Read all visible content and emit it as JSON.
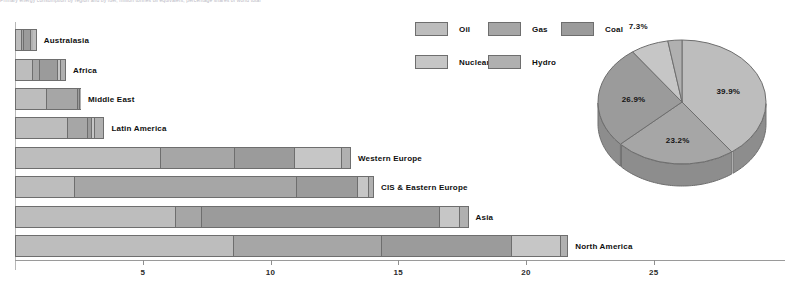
{
  "caption": {
    "text": "Primary energy consumption by region and by fuel, million tonnes oil equivalent, percentage shares of world total"
  },
  "chart_data": [
    {
      "type": "bar",
      "orientation": "horizontal",
      "stacked": true,
      "title": "",
      "xlabel": "",
      "ylabel": "",
      "xlim": [
        0,
        29
      ],
      "grid": false,
      "legend_position": "top-center",
      "categories": [
        "Australasia",
        "Africa",
        "Middle East",
        "Latin America",
        "Western Europe",
        "CIS & Eastern Europe",
        "Asia",
        "North America"
      ],
      "series": [
        {
          "name": "Oil",
          "values": [
            0.28,
            0.73,
            1.25,
            2.15,
            5.75,
            2.3,
            6.3,
            8.6
          ]
        },
        {
          "name": "Gas",
          "values": [
            0.1,
            0.23,
            1.3,
            0.8,
            2.9,
            8.8,
            1.0,
            5.8
          ]
        },
        {
          "name": "Coal",
          "values": [
            0.36,
            0.77,
            0.02,
            0.1,
            2.35,
            2.4,
            9.4,
            5.1
          ]
        },
        {
          "name": "Nuclear",
          "values": [
            0.0,
            0.1,
            0.0,
            0.08,
            1.85,
            0.4,
            0.75,
            1.9
          ]
        },
        {
          "name": "Hydro",
          "values": [
            0.11,
            0.17,
            0.01,
            0.37,
            0.3,
            0.15,
            0.3,
            0.25
          ]
        }
      ],
      "totals": [
        0.85,
        2.0,
        2.58,
        3.5,
        13.15,
        14.05,
        17.75,
        21.65
      ],
      "tick_labels": [
        "5",
        "10",
        "15",
        "20",
        "25"
      ],
      "tick_values": [
        5,
        10,
        15,
        20,
        25
      ]
    },
    {
      "type": "pie",
      "three_d": true,
      "title": "",
      "labels": [
        "Oil",
        "Gas",
        "Coal",
        "Nuclear",
        "Hydro"
      ],
      "values": [
        39.9,
        23.2,
        26.9,
        7.3,
        2.7
      ],
      "data_labels": [
        "39.9%",
        "23.2%",
        "26.9%",
        "7.3%",
        "2.7%"
      ],
      "legend_position": "left"
    }
  ],
  "legend": {
    "items": [
      {
        "label": "Oil",
        "color": "#bdbdbd"
      },
      {
        "label": "Gas",
        "color": "#a6a6a6"
      },
      {
        "label": "Coal",
        "color": "#9b9b9b"
      },
      {
        "label": "Nuclear",
        "color": "#c6c6c6"
      },
      {
        "label": "Hydro",
        "color": "#b0b0b0"
      }
    ]
  },
  "colors": {
    "oil": "#bdbdbd",
    "gas": "#a6a6a6",
    "coal": "#9b9b9b",
    "nuclear": "#c6c6c6",
    "hydro": "#b0b0b0",
    "pie_side": "#8d8d8d",
    "stroke": "#6e6e6e",
    "axis": "#9a9a9a",
    "text": "#0f0f0f",
    "background": "#ffffff"
  }
}
